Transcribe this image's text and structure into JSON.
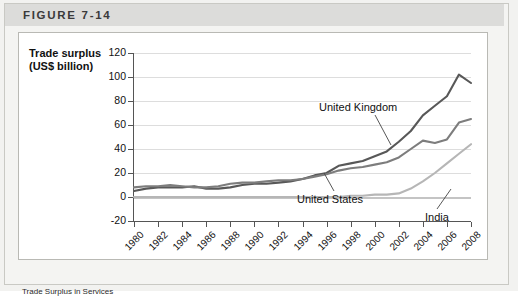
{
  "figure": {
    "header_label": "FIGURE 7-14",
    "caption": "Trade Surplus in Services"
  },
  "chart_data": {
    "type": "line",
    "title": "",
    "xlabel": "",
    "ylabel": "Trade surplus\n(US$ billion)",
    "ylim": [
      -20,
      120
    ],
    "xlim": [
      1980,
      2008
    ],
    "grid": true,
    "legend_position": "inline-annotations",
    "y_ticks": [
      120,
      100,
      80,
      60,
      40,
      20,
      0,
      -20
    ],
    "x_ticks": [
      1980,
      1982,
      1984,
      1986,
      1988,
      1990,
      1992,
      1994,
      1996,
      1998,
      2000,
      2002,
      2004,
      2006,
      2008
    ],
    "x": [
      1980,
      1981,
      1982,
      1983,
      1984,
      1985,
      1986,
      1987,
      1988,
      1989,
      1990,
      1991,
      1992,
      1993,
      1994,
      1995,
      1996,
      1997,
      1998,
      1999,
      2000,
      2001,
      2002,
      2003,
      2004,
      2005,
      2006,
      2007,
      2008
    ],
    "series": [
      {
        "name": "United Kingdom",
        "color": "#585858",
        "values": [
          5,
          7,
          8,
          8,
          8,
          9,
          7,
          7,
          8,
          10,
          11,
          11,
          12,
          13,
          15,
          18,
          20,
          26,
          28,
          30,
          34,
          38,
          46,
          55,
          68,
          76,
          84,
          102,
          95
        ]
      },
      {
        "name": "United States",
        "color": "#7d7d7d",
        "values": [
          8,
          9,
          9,
          10,
          9,
          8,
          8,
          9,
          11,
          12,
          12,
          13,
          14,
          14,
          15,
          17,
          19,
          22,
          24,
          25,
          27,
          29,
          33,
          40,
          47,
          45,
          48,
          62,
          65
        ]
      },
      {
        "name": "India",
        "color": "#b6b6b6",
        "values": [
          0,
          0,
          0,
          0,
          0,
          0,
          0,
          0,
          0,
          0,
          0,
          0,
          0,
          0,
          0,
          0,
          0,
          0,
          1,
          1,
          2,
          2,
          3,
          7,
          13,
          20,
          28,
          36,
          44
        ]
      }
    ]
  }
}
